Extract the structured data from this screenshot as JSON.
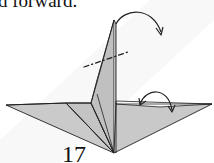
{
  "caption": {
    "text": "d forward."
  },
  "step": {
    "number": "17"
  },
  "colors": {
    "paper_fill": "#c8c8c8",
    "paper_fill_light": "#d2d2d2",
    "line": "#222222",
    "background": "#ffffff",
    "watermark_band": "#f2f2f2"
  },
  "diagram": {
    "elements": [
      {
        "name": "valley-fold-line",
        "style": "dash-dot"
      },
      {
        "name": "reverse-fold-arrow",
        "style": "curved arrow"
      },
      {
        "name": "wing-fold-arrow",
        "style": "curved arrow"
      }
    ]
  }
}
